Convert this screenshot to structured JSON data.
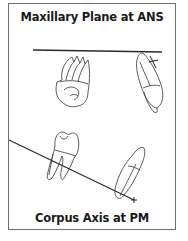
{
  "figure": {
    "top_label": "Maxillary Plane at ANS",
    "bottom_label": "Corpus Axis at PM",
    "elements": {
      "maxillary_plane_line": "horizontal reference line",
      "molar_upper": "upper molar tooth outline",
      "incisor_upper": "upper incisor tooth outline with plus marker",
      "corpus_axis_line": "diagonal reference line ending with plus marker",
      "molar_lower": "lower molar tooth outline",
      "incisor_lower": "lower incisor tooth outline"
    },
    "colors": {
      "line": "#2a2a2a",
      "tooth_outline": "#333333",
      "frame": "#707070",
      "text": "#1a1a1a"
    }
  }
}
